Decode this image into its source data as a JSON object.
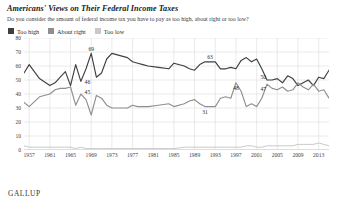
{
  "header": {
    "title": "Americans' Views on Their Federal Income Taxes",
    "subtitle": "Do you consider the amount of federal income tax you have to pay as too high, about right or too low?"
  },
  "footer": {
    "brand": "GALLUP"
  },
  "colors": {
    "too_high": "#3f3f3f",
    "about_right": "#8f8f8f",
    "too_low": "#c9c9c9",
    "grid": "#d8d8d8",
    "axis": "#b4b4b4"
  },
  "chart_data": {
    "type": "line",
    "title": "Americans' Views on Their Federal Income Taxes",
    "subtitle": "Do you consider the amount of federal income tax you have to pay as too high, about right or too low?",
    "xlabel": "",
    "ylabel": "",
    "ylim": [
      0,
      80
    ],
    "ytick_step": 10,
    "yticks": [
      0,
      10,
      20,
      30,
      40,
      50,
      60,
      70,
      80
    ],
    "xlim": [
      1956,
      2015
    ],
    "xticks": [
      1957,
      1961,
      1965,
      1969,
      1973,
      1977,
      1981,
      1985,
      1989,
      1993,
      1997,
      2001,
      2005,
      2009,
      2013
    ],
    "grid": true,
    "legend_position": "top-left",
    "legend": [
      "Too high",
      "About right",
      "Too low"
    ],
    "annotations": [
      {
        "label": "46",
        "x": 1969,
        "y": 46,
        "series": "Too high"
      },
      {
        "label": "45",
        "x": 1969,
        "y": 45,
        "series": "About right"
      },
      {
        "label": "69",
        "x": 1969,
        "y": 69,
        "series": "Too high"
      },
      {
        "label": "63",
        "x": 1992,
        "y": 63,
        "series": "Too high"
      },
      {
        "label": "31",
        "x": 1991,
        "y": 31,
        "series": "About right"
      },
      {
        "label": "48",
        "x": 1997,
        "y": 48,
        "series": "About right"
      },
      {
        "label": "50",
        "x": 2003,
        "y": 50,
        "series": "Too high"
      },
      {
        "label": "47",
        "x": 2003,
        "y": 47,
        "series": "About right"
      },
      {
        "label": "57",
        "x": 2015,
        "y": 57,
        "series": "Too high"
      },
      {
        "label": "37",
        "x": 2015,
        "y": 37,
        "series": "About right"
      }
    ],
    "series": [
      {
        "name": "Too high",
        "color": "#3f3f3f",
        "points": [
          [
            1956,
            55
          ],
          [
            1957,
            61
          ],
          [
            1959,
            51
          ],
          [
            1961,
            46
          ],
          [
            1962,
            48
          ],
          [
            1963,
            52
          ],
          [
            1964,
            56
          ],
          [
            1965,
            46
          ],
          [
            1966,
            61
          ],
          [
            1967,
            49
          ],
          [
            1968,
            58
          ],
          [
            1969,
            69
          ],
          [
            1970,
            52
          ],
          [
            1971,
            55
          ],
          [
            1972,
            65
          ],
          [
            1973,
            69
          ],
          [
            1976,
            66
          ],
          [
            1977,
            63
          ],
          [
            1978,
            62
          ],
          [
            1979,
            61
          ],
          [
            1980,
            60
          ],
          [
            1982,
            59
          ],
          [
            1984,
            58
          ],
          [
            1985,
            62
          ],
          [
            1987,
            60
          ],
          [
            1988,
            58
          ],
          [
            1989,
            57
          ],
          [
            1990,
            61
          ],
          [
            1991,
            63
          ],
          [
            1992,
            63
          ],
          [
            1993,
            63
          ],
          [
            1994,
            58
          ],
          [
            1995,
            58
          ],
          [
            1996,
            59
          ],
          [
            1997,
            58
          ],
          [
            1998,
            64
          ],
          [
            1999,
            66
          ],
          [
            2000,
            63
          ],
          [
            2001,
            65
          ],
          [
            2002,
            58
          ],
          [
            2003,
            50
          ],
          [
            2004,
            50
          ],
          [
            2005,
            51
          ],
          [
            2006,
            48
          ],
          [
            2007,
            53
          ],
          [
            2008,
            51
          ],
          [
            2009,
            46
          ],
          [
            2010,
            48
          ],
          [
            2011,
            50
          ],
          [
            2012,
            46
          ],
          [
            2013,
            52
          ],
          [
            2014,
            51
          ],
          [
            2015,
            57
          ]
        ]
      },
      {
        "name": "About right",
        "color": "#8f8f8f",
        "points": [
          [
            1956,
            34
          ],
          [
            1957,
            31
          ],
          [
            1959,
            38
          ],
          [
            1961,
            40
          ],
          [
            1962,
            43
          ],
          [
            1963,
            44
          ],
          [
            1964,
            44
          ],
          [
            1965,
            45
          ],
          [
            1966,
            32
          ],
          [
            1967,
            40
          ],
          [
            1968,
            36
          ],
          [
            1969,
            25
          ],
          [
            1970,
            39
          ],
          [
            1971,
            37
          ],
          [
            1972,
            32
          ],
          [
            1973,
            30
          ],
          [
            1976,
            30
          ],
          [
            1977,
            32
          ],
          [
            1978,
            31
          ],
          [
            1979,
            31
          ],
          [
            1980,
            31
          ],
          [
            1982,
            32
          ],
          [
            1984,
            33
          ],
          [
            1985,
            31
          ],
          [
            1987,
            33
          ],
          [
            1988,
            35
          ],
          [
            1989,
            36
          ],
          [
            1990,
            33
          ],
          [
            1991,
            31
          ],
          [
            1992,
            31
          ],
          [
            1993,
            31
          ],
          [
            1994,
            37
          ],
          [
            1995,
            38
          ],
          [
            1996,
            37
          ],
          [
            1997,
            48
          ],
          [
            1998,
            42
          ],
          [
            1999,
            31
          ],
          [
            2000,
            33
          ],
          [
            2001,
            31
          ],
          [
            2002,
            37
          ],
          [
            2003,
            47
          ],
          [
            2004,
            44
          ],
          [
            2005,
            43
          ],
          [
            2006,
            45
          ],
          [
            2007,
            42
          ],
          [
            2008,
            43
          ],
          [
            2009,
            48
          ],
          [
            2010,
            45
          ],
          [
            2011,
            43
          ],
          [
            2012,
            47
          ],
          [
            2013,
            42
          ],
          [
            2014,
            43
          ],
          [
            2015,
            37
          ]
        ]
      },
      {
        "name": "Too low",
        "color": "#c9c9c9",
        "points": [
          [
            1956,
            3
          ],
          [
            1957,
            2
          ],
          [
            1959,
            2
          ],
          [
            1961,
            2
          ],
          [
            1962,
            2
          ],
          [
            1963,
            2
          ],
          [
            1964,
            2
          ],
          [
            1965,
            2
          ],
          [
            1966,
            1
          ],
          [
            1967,
            2
          ],
          [
            1968,
            1
          ],
          [
            1969,
            1
          ],
          [
            1970,
            1
          ],
          [
            1971,
            1
          ],
          [
            1972,
            1
          ],
          [
            1973,
            1
          ],
          [
            1976,
            1
          ],
          [
            1977,
            1
          ],
          [
            1978,
            1
          ],
          [
            1979,
            1
          ],
          [
            1980,
            1
          ],
          [
            1982,
            1
          ],
          [
            1984,
            1
          ],
          [
            1985,
            1
          ],
          [
            1987,
            2
          ],
          [
            1988,
            2
          ],
          [
            1989,
            2
          ],
          [
            1990,
            2
          ],
          [
            1991,
            2
          ],
          [
            1992,
            2
          ],
          [
            1993,
            2
          ],
          [
            1994,
            2
          ],
          [
            1995,
            2
          ],
          [
            1996,
            2
          ],
          [
            1997,
            2
          ],
          [
            1998,
            2
          ],
          [
            1999,
            3
          ],
          [
            2000,
            3
          ],
          [
            2001,
            2
          ],
          [
            2002,
            2
          ],
          [
            2003,
            3
          ],
          [
            2004,
            3
          ],
          [
            2005,
            3
          ],
          [
            2006,
            3
          ],
          [
            2007,
            3
          ],
          [
            2008,
            3
          ],
          [
            2009,
            4
          ],
          [
            2010,
            4
          ],
          [
            2011,
            4
          ],
          [
            2012,
            4
          ],
          [
            2013,
            5
          ],
          [
            2014,
            4
          ],
          [
            2015,
            3
          ]
        ]
      }
    ]
  }
}
